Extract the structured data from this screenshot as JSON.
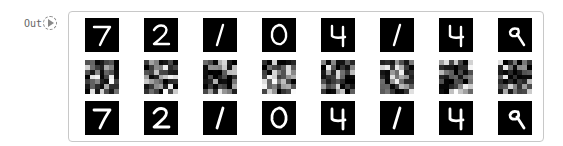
{
  "cell": {
    "prompt_label": "Out",
    "run_icon": "play-circle-icon"
  },
  "output": {
    "rows": [
      {
        "name": "original",
        "labels": [
          "7",
          "2",
          "1",
          "0",
          "4",
          "1",
          "4",
          "9"
        ]
      },
      {
        "name": "encoded",
        "labels": [
          "noise",
          "noise",
          "noise",
          "noise",
          "noise",
          "noise",
          "noise",
          "noise"
        ]
      },
      {
        "name": "reconstructed",
        "labels": [
          "7",
          "2",
          "1",
          "0",
          "4",
          "1",
          "4",
          "9"
        ]
      }
    ],
    "colors": {
      "tile_bg": "#000000",
      "stroke": "#ffffff",
      "border": "#c8c8c8"
    }
  }
}
